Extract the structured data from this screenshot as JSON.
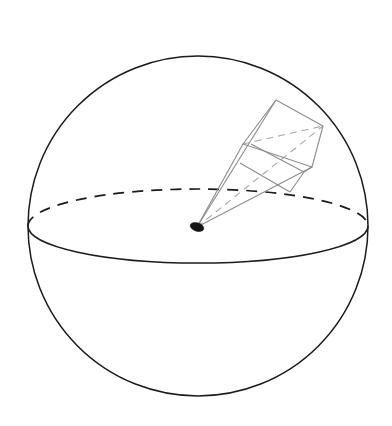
{
  "figure": {
    "title": "Solid angle subtended at the centre of a sphere",
    "caption": "",
    "background_color": "#ffffff",
    "canvas": {
      "width": 392,
      "height": 426
    }
  },
  "colors": {
    "sphere_stroke": "#1b1b1b",
    "equator_stroke": "#1b1b1b",
    "pyramid_stroke": "#8e8e8e",
    "hidden_stroke": "#a9a9a9",
    "apex_fill": "#141414",
    "background": "#ffffff"
  },
  "geometry": {
    "sphere": {
      "label": "sphere",
      "center_x": 198,
      "center_y": 226,
      "radius": 170,
      "stroke_width": 1.5,
      "style": "solid"
    },
    "equator": {
      "label": "equatorial great circle",
      "center_x": 198,
      "center_y": 226,
      "radius_x": 170,
      "radius_y": 37,
      "front_style": "solid",
      "back_style": "dashed",
      "dash_pattern": "11 8"
    },
    "apex": {
      "label": "sphere centre / apex of solid angle",
      "x": 197,
      "y": 227,
      "radius_x": 7,
      "radius_y": 4.2,
      "rotation_deg": 18,
      "style": "filled"
    },
    "cone": {
      "label": "solid-angle pyramid",
      "far_face_vertices": [
        {
          "name": "top",
          "x": 276,
          "y": 100
        },
        {
          "name": "right",
          "x": 323,
          "y": 126
        },
        {
          "name": "bottom",
          "x": 312,
          "y": 167
        },
        {
          "name": "left",
          "x": 243,
          "y": 144
        }
      ],
      "near_face_vertices": [
        {
          "name": "near-top-left",
          "x": 251,
          "y": 144
        },
        {
          "name": "near-top-right",
          "x": 304,
          "y": 172
        },
        {
          "name": "near-bottom-right",
          "x": 290,
          "y": 192
        },
        {
          "name": "near-bottom-left",
          "x": 240,
          "y": 163
        }
      ],
      "visible_edges": [
        {
          "from": "apex",
          "to": "top"
        },
        {
          "from": "apex",
          "to": "left"
        },
        {
          "from": "apex",
          "to": "bottom"
        }
      ],
      "hidden_edges": [
        {
          "from": "apex",
          "to": "right",
          "style": "dashed"
        },
        {
          "from": "left",
          "to": "right",
          "style": "dashed"
        }
      ]
    }
  },
  "chart_data": {
    "type": "diagram",
    "title": "Solid angle subtended at the centre of a sphere",
    "elements": [
      {
        "name": "sphere",
        "kind": "circle",
        "center": [
          198,
          226
        ],
        "radius": 170
      },
      {
        "name": "equator",
        "kind": "ellipse",
        "center": [
          198,
          226
        ],
        "radii": [
          170,
          37
        ]
      },
      {
        "name": "centre-point",
        "kind": "point",
        "position": [
          197,
          227
        ]
      },
      {
        "name": "solid-angle-pyramid",
        "kind": "polyhedron",
        "apex": [
          197,
          227
        ],
        "base_quad": [
          [
            276,
            100
          ],
          [
            323,
            126
          ],
          [
            312,
            167
          ],
          [
            243,
            144
          ]
        ]
      },
      {
        "name": "cross-section-quad",
        "kind": "polygon",
        "vertices": [
          [
            251,
            144
          ],
          [
            304,
            172
          ],
          [
            290,
            192
          ],
          [
            240,
            163
          ]
        ]
      }
    ]
  }
}
